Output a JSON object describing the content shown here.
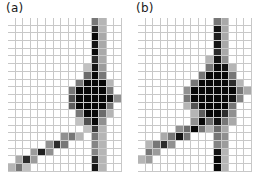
{
  "figure": {
    "type": "two-panel-grayscale-heatmap",
    "background_color": "#ffffff",
    "grid_line_color": "#c8c8c8",
    "grid_columns": 15,
    "grid_rows": 20
  },
  "panels": [
    {
      "label": "(a)",
      "name": "panel-a"
    },
    {
      "label": "(b)",
      "name": "panel-b"
    }
  ],
  "chart_data": {
    "type": "heatmap",
    "title": "",
    "subtitle": "",
    "xlabel": "",
    "ylabel": "",
    "colormap": "grayscale-inverted",
    "value_range": [
      0,
      1
    ],
    "grid": true,
    "legend": "none",
    "panel_labels": [
      "(a)",
      "(b)"
    ],
    "columns": 15,
    "rows": 20,
    "series": [
      {
        "name": "(a)",
        "values": [
          [
            0.0,
            0.0,
            0.0,
            0.0,
            0.0,
            0.0,
            0.0,
            0.0,
            0.0,
            0.0,
            0.0,
            0.55,
            0.3,
            0.0,
            0.0
          ],
          [
            0.0,
            0.0,
            0.0,
            0.0,
            0.0,
            0.0,
            0.0,
            0.0,
            0.0,
            0.0,
            0.0,
            0.85,
            0.3,
            0.0,
            0.0
          ],
          [
            0.0,
            0.0,
            0.0,
            0.0,
            0.0,
            0.0,
            0.0,
            0.0,
            0.0,
            0.0,
            0.0,
            1.0,
            0.35,
            0.0,
            0.0
          ],
          [
            0.0,
            0.0,
            0.0,
            0.0,
            0.0,
            0.0,
            0.0,
            0.0,
            0.0,
            0.0,
            0.0,
            0.95,
            0.35,
            0.0,
            0.0
          ],
          [
            0.0,
            0.0,
            0.0,
            0.0,
            0.0,
            0.0,
            0.0,
            0.0,
            0.0,
            0.0,
            0.0,
            1.0,
            0.35,
            0.0,
            0.0
          ],
          [
            0.0,
            0.0,
            0.0,
            0.0,
            0.0,
            0.0,
            0.0,
            0.0,
            0.0,
            0.0,
            0.0,
            0.85,
            0.35,
            0.0,
            0.0
          ],
          [
            0.0,
            0.0,
            0.0,
            0.0,
            0.0,
            0.0,
            0.0,
            0.0,
            0.0,
            0.0,
            0.25,
            0.95,
            0.4,
            0.0,
            0.0
          ],
          [
            0.0,
            0.0,
            0.0,
            0.0,
            0.0,
            0.0,
            0.0,
            0.0,
            0.0,
            0.0,
            0.6,
            1.0,
            0.55,
            0.0,
            0.0
          ],
          [
            0.0,
            0.0,
            0.0,
            0.0,
            0.0,
            0.0,
            0.0,
            0.0,
            0.0,
            0.55,
            1.0,
            1.0,
            1.0,
            0.3,
            0.0
          ],
          [
            0.0,
            0.0,
            0.0,
            0.0,
            0.0,
            0.0,
            0.0,
            0.0,
            0.55,
            1.0,
            1.0,
            1.0,
            1.0,
            0.55,
            0.0
          ],
          [
            0.0,
            0.0,
            0.0,
            0.0,
            0.0,
            0.0,
            0.0,
            0.0,
            0.7,
            1.0,
            1.0,
            1.0,
            1.0,
            0.95,
            0.45
          ],
          [
            0.0,
            0.0,
            0.0,
            0.0,
            0.0,
            0.0,
            0.0,
            0.0,
            0.65,
            1.0,
            1.0,
            1.0,
            1.0,
            0.55,
            0.0
          ],
          [
            0.0,
            0.0,
            0.0,
            0.0,
            0.0,
            0.0,
            0.0,
            0.0,
            0.0,
            0.55,
            1.0,
            1.0,
            0.6,
            0.3,
            0.0
          ],
          [
            0.0,
            0.0,
            0.0,
            0.0,
            0.0,
            0.0,
            0.0,
            0.0,
            0.0,
            0.25,
            0.7,
            1.0,
            0.45,
            0.0,
            0.0
          ],
          [
            0.0,
            0.0,
            0.0,
            0.0,
            0.0,
            0.0,
            0.0,
            0.0,
            0.0,
            0.0,
            0.25,
            0.8,
            0.3,
            0.0,
            0.0
          ],
          [
            0.0,
            0.0,
            0.0,
            0.0,
            0.0,
            0.0,
            0.0,
            0.45,
            0.55,
            0.3,
            0.0,
            0.55,
            0.3,
            0.0,
            0.0
          ],
          [
            0.0,
            0.0,
            0.0,
            0.0,
            0.0,
            0.45,
            0.85,
            0.55,
            0.0,
            0.0,
            0.0,
            0.5,
            0.3,
            0.0,
            0.0
          ],
          [
            0.0,
            0.0,
            0.0,
            0.4,
            0.9,
            0.45,
            0.0,
            0.0,
            0.0,
            0.0,
            0.0,
            0.5,
            0.3,
            0.0,
            0.0
          ],
          [
            0.0,
            0.35,
            0.85,
            0.4,
            0.0,
            0.0,
            0.0,
            0.0,
            0.0,
            0.0,
            0.0,
            0.85,
            0.3,
            0.0,
            0.0
          ],
          [
            0.3,
            0.55,
            0.25,
            0.0,
            0.0,
            0.0,
            0.0,
            0.0,
            0.0,
            0.0,
            0.0,
            0.95,
            0.3,
            0.0,
            0.0
          ]
        ]
      },
      {
        "name": "(b)",
        "values": [
          [
            0.0,
            0.0,
            0.0,
            0.0,
            0.0,
            0.0,
            0.0,
            0.0,
            0.0,
            0.0,
            0.55,
            0.35,
            0.0,
            0.0,
            0.0
          ],
          [
            0.0,
            0.0,
            0.0,
            0.0,
            0.0,
            0.0,
            0.0,
            0.0,
            0.0,
            0.0,
            0.95,
            0.35,
            0.0,
            0.0,
            0.0
          ],
          [
            0.0,
            0.0,
            0.0,
            0.0,
            0.0,
            0.0,
            0.0,
            0.0,
            0.0,
            0.0,
            0.9,
            0.35,
            0.0,
            0.0,
            0.0
          ],
          [
            0.0,
            0.0,
            0.0,
            0.0,
            0.0,
            0.0,
            0.0,
            0.0,
            0.0,
            0.0,
            0.95,
            0.35,
            0.0,
            0.0,
            0.0
          ],
          [
            0.0,
            0.0,
            0.0,
            0.0,
            0.0,
            0.0,
            0.0,
            0.0,
            0.0,
            0.0,
            0.85,
            0.35,
            0.0,
            0.0,
            0.0
          ],
          [
            0.0,
            0.0,
            0.0,
            0.0,
            0.0,
            0.0,
            0.0,
            0.0,
            0.0,
            0.3,
            0.95,
            0.45,
            0.0,
            0.0,
            0.0
          ],
          [
            0.0,
            0.0,
            0.0,
            0.0,
            0.0,
            0.0,
            0.0,
            0.0,
            0.0,
            0.55,
            1.0,
            0.95,
            0.3,
            0.0,
            0.0
          ],
          [
            0.0,
            0.0,
            0.0,
            0.0,
            0.0,
            0.0,
            0.0,
            0.0,
            0.55,
            1.0,
            1.0,
            1.0,
            0.55,
            0.0,
            0.0
          ],
          [
            0.0,
            0.0,
            0.0,
            0.0,
            0.0,
            0.0,
            0.0,
            0.55,
            1.0,
            1.0,
            1.0,
            1.0,
            0.85,
            0.3,
            0.0
          ],
          [
            0.0,
            0.0,
            0.0,
            0.0,
            0.0,
            0.0,
            0.45,
            1.0,
            1.0,
            1.0,
            1.0,
            1.0,
            1.0,
            0.55,
            0.35
          ],
          [
            0.0,
            0.0,
            0.0,
            0.0,
            0.0,
            0.0,
            0.55,
            1.0,
            1.0,
            1.0,
            1.0,
            1.0,
            0.95,
            0.5,
            0.0
          ],
          [
            0.0,
            0.0,
            0.0,
            0.0,
            0.0,
            0.0,
            0.3,
            0.7,
            1.0,
            1.0,
            1.0,
            1.0,
            0.55,
            0.0,
            0.0
          ],
          [
            0.0,
            0.0,
            0.0,
            0.0,
            0.0,
            0.0,
            0.0,
            0.3,
            0.65,
            1.0,
            1.0,
            0.85,
            0.45,
            0.0,
            0.0
          ],
          [
            0.0,
            0.0,
            0.0,
            0.0,
            0.0,
            0.0,
            0.0,
            0.45,
            1.0,
            0.6,
            0.95,
            0.55,
            0.35,
            0.0,
            0.0
          ],
          [
            0.0,
            0.0,
            0.0,
            0.0,
            0.0,
            0.45,
            0.6,
            1.0,
            0.55,
            0.3,
            0.6,
            0.35,
            0.0,
            0.0,
            0.0
          ],
          [
            0.0,
            0.0,
            0.0,
            0.35,
            0.55,
            0.95,
            0.55,
            0.0,
            0.0,
            0.0,
            0.55,
            0.45,
            0.0,
            0.0,
            0.0
          ],
          [
            0.0,
            0.3,
            0.55,
            0.85,
            0.45,
            0.0,
            0.0,
            0.0,
            0.0,
            0.0,
            0.5,
            0.4,
            0.0,
            0.0,
            0.0
          ],
          [
            0.0,
            0.55,
            0.4,
            0.0,
            0.0,
            0.0,
            0.0,
            0.0,
            0.0,
            0.0,
            0.95,
            0.3,
            0.0,
            0.0,
            0.0
          ],
          [
            0.3,
            0.4,
            0.0,
            0.0,
            0.0,
            0.0,
            0.0,
            0.0,
            0.0,
            0.0,
            1.0,
            0.3,
            0.0,
            0.0,
            0.0
          ],
          [
            0.0,
            0.0,
            0.0,
            0.0,
            0.0,
            0.0,
            0.0,
            0.0,
            0.0,
            0.0,
            1.0,
            0.3,
            0.0,
            0.0,
            0.0
          ]
        ]
      }
    ]
  }
}
